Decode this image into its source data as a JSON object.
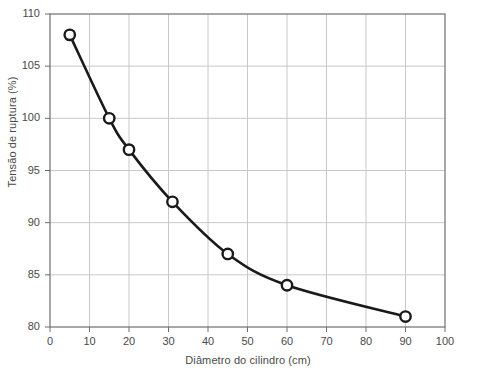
{
  "chart_data": {
    "type": "line",
    "title": "",
    "subtitle": "",
    "xlabel": "Diâmetro do cilindro (cm)",
    "ylabel": "Tensão de ruptura (%)",
    "xlim": [
      0,
      100
    ],
    "ylim": [
      80,
      110
    ],
    "xticks": [
      0,
      10,
      20,
      30,
      40,
      50,
      60,
      70,
      80,
      90,
      100
    ],
    "yticks": [
      80,
      85,
      90,
      95,
      100,
      105,
      110
    ],
    "xtick_labels": [
      "0",
      "10",
      "20",
      "30",
      "40",
      "50",
      "60",
      "70",
      "80",
      "90",
      "100"
    ],
    "ytick_labels": [
      "80",
      "85",
      "90",
      "95",
      "100",
      "105",
      "110"
    ],
    "grid": true,
    "grid_color": "#c8c8c8",
    "legend": false,
    "legend_position": "none",
    "marker": "open-circle",
    "marker_color": "#1a1a1a",
    "line_color": "#1a1a1a",
    "line_width": 2.6,
    "series": [
      {
        "name": "Tensão de ruptura",
        "x": [
          5,
          15,
          20,
          31,
          45,
          60,
          90
        ],
        "values": [
          108,
          100,
          97,
          92,
          87,
          84,
          81
        ]
      }
    ],
    "points": [
      {
        "x": 5,
        "y": 108
      },
      {
        "x": 15,
        "y": 100
      },
      {
        "x": 20,
        "y": 97
      },
      {
        "x": 31,
        "y": 92
      },
      {
        "x": 45,
        "y": 87
      },
      {
        "x": 60,
        "y": 84
      },
      {
        "x": 90,
        "y": 81
      }
    ],
    "annotations": []
  },
  "plot": {
    "frame_color": "#6e6e6e",
    "background": "#ffffff"
  }
}
